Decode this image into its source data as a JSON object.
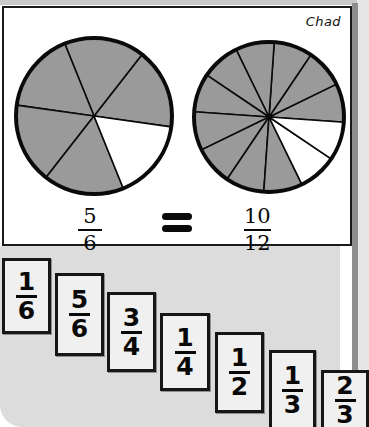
{
  "page": {
    "student_name": "Chad",
    "background_color": "#dcdcdc",
    "panel_color": "#ffffff",
    "shaded_color": "#9a9a9a",
    "line_color": "#0a0a0a"
  },
  "equation": {
    "left_fraction": {
      "numerator": "5",
      "denominator": "6"
    },
    "operator": "=",
    "right_fraction": {
      "numerator": "10",
      "denominator": "12"
    }
  },
  "chart_data": {
    "type": "pie",
    "charts": [
      {
        "name": "left-circle",
        "slices": 6,
        "shaded": 5,
        "unshaded": 1,
        "fraction": "5/6",
        "slice_fill": [
          "shaded",
          "shaded",
          "shaded",
          "shaded",
          "shaded",
          "unshaded"
        ],
        "start_angle_deg": -8,
        "center": [
          90,
          110
        ],
        "radius": 78
      },
      {
        "name": "right-circle",
        "slices": 12,
        "shaded": 10,
        "unshaded": 2,
        "fraction": "10/12",
        "slice_fill": [
          "shaded",
          "shaded",
          "shaded",
          "shaded",
          "shaded",
          "shaded",
          "shaded",
          "shaded",
          "shaded",
          "shaded",
          "unshaded",
          "unshaded"
        ],
        "start_angle_deg": -4,
        "center": [
          265,
          110
        ],
        "radius": 75
      }
    ]
  },
  "cards": [
    {
      "numerator": "1",
      "denominator": "6"
    },
    {
      "numerator": "5",
      "denominator": "6"
    },
    {
      "numerator": "3",
      "denominator": "4"
    },
    {
      "numerator": "1",
      "denominator": "4"
    },
    {
      "numerator": "1",
      "denominator": "2"
    },
    {
      "numerator": "1",
      "denominator": "3"
    },
    {
      "numerator": "2",
      "denominator": "3"
    }
  ]
}
